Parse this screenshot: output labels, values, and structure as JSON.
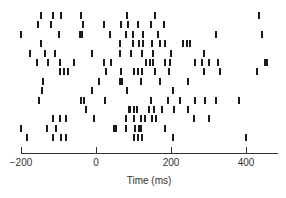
{
  "chart_data": {
    "type": "scatter",
    "subtype": "raster",
    "title": "",
    "xlabel": "Time (ms)",
    "ylabel": "",
    "xlim": [
      -200,
      480
    ],
    "x_ticks": [
      -200,
      0,
      200,
      400
    ],
    "x_tick_labels": [
      "−200",
      "0",
      "200",
      "400"
    ],
    "grid": false,
    "legend": null,
    "rows": [
      {
        "trial": 1,
        "spikes": [
          -147,
          -115,
          -93,
          -40,
          83,
          157,
          434
        ]
      },
      {
        "trial": 2,
        "spikes": [
          -155,
          -120,
          -35,
          20,
          67,
          85,
          111,
          147,
          182
        ]
      },
      {
        "trial": 3,
        "spikes": [
          -200,
          -100,
          -42,
          -38,
          37,
          80,
          99,
          125,
          166,
          320,
          442
        ]
      },
      {
        "trial": 4,
        "spikes": [
          -148,
          64,
          98,
          115,
          125,
          150,
          170,
          184,
          233,
          242,
          250
        ]
      },
      {
        "trial": 5,
        "spikes": [
          -176,
          -135,
          -110,
          -10,
          64,
          94,
          123,
          152,
          199,
          289
        ]
      },
      {
        "trial": 6,
        "spikes": [
          -157,
          -128,
          -96,
          -59,
          20,
          40,
          132,
          143,
          152,
          185,
          197,
          264,
          282,
          300,
          325,
          450,
          456
        ]
      },
      {
        "trial": 7,
        "spikes": [
          -96,
          -85,
          -75,
          27,
          66,
          100,
          112,
          122,
          158,
          195,
          288,
          330,
          430
        ]
      },
      {
        "trial": 8,
        "spikes": [
          -141,
          8,
          65,
          68,
          120,
          170,
          245
        ]
      },
      {
        "trial": 9,
        "spikes": [
          -143,
          -10,
          83,
          206
        ]
      },
      {
        "trial": 10,
        "spikes": [
          -152,
          -40,
          -32,
          24,
          147,
          192,
          225,
          265,
          290,
          320,
          380
        ]
      },
      {
        "trial": 11,
        "spikes": [
          -26,
          88,
          91,
          100,
          110,
          140,
          155,
          175,
          209,
          245
        ]
      },
      {
        "trial": 12,
        "spikes": [
          -115,
          -96,
          -80,
          -5,
          80,
          102,
          120,
          130,
          150,
          160,
          260,
          300
        ]
      },
      {
        "trial": 13,
        "spikes": [
          -200,
          -130,
          -107,
          48,
          54,
          80,
          103,
          115,
          120,
          185
        ]
      },
      {
        "trial": 14,
        "spikes": [
          -185,
          -116,
          -94,
          -80,
          100,
          112,
          123,
          205,
          400
        ]
      }
    ]
  }
}
